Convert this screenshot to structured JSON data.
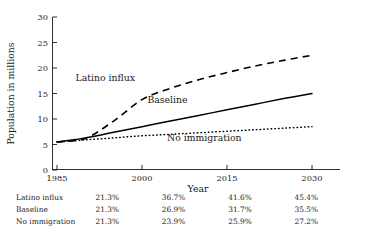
{
  "chart_data": {
    "type": "line",
    "title": "",
    "xlabel": "Year",
    "ylabel": "Population in millions",
    "xlim": [
      1985,
      2032
    ],
    "ylim": [
      0,
      30
    ],
    "xticks": [
      1985,
      2000,
      2015,
      2030
    ],
    "yticks": [
      0,
      5,
      10,
      15,
      20,
      25,
      30
    ],
    "grid": false,
    "legend_position": "inline-labels",
    "x": [
      1985,
      1990,
      1995,
      2000,
      2005,
      2010,
      2015,
      2020,
      2025,
      2030
    ],
    "series": [
      {
        "name": "Latino influx",
        "style": "dashed",
        "color": "#000000",
        "values": [
          5.5,
          6.2,
          9.6,
          13.8,
          16.0,
          17.7,
          19.1,
          20.4,
          21.5,
          22.5
        ]
      },
      {
        "name": "Baseline",
        "style": "solid",
        "color": "#000000",
        "values": [
          5.5,
          6.3,
          7.4,
          8.5,
          9.6,
          10.7,
          11.8,
          12.9,
          14.0,
          15.0
        ]
      },
      {
        "name": "No immigration",
        "style": "dotted",
        "color": "#000000",
        "values": [
          5.5,
          5.9,
          6.3,
          6.7,
          7.0,
          7.3,
          7.6,
          7.9,
          8.2,
          8.5
        ]
      }
    ],
    "annotations": [
      {
        "text": "Latino influx",
        "x": 1993.5,
        "y": 17.4
      },
      {
        "text": "Baseline",
        "x": 2004.5,
        "y": 13.1
      },
      {
        "text": "No immigration",
        "x": 2011.0,
        "y": 5.6
      }
    ]
  },
  "axes": {
    "ylabel": "Population in millions",
    "xlabel": "Year",
    "ytick_labels": [
      "30",
      "25",
      "20",
      "15",
      "10",
      "5",
      "0"
    ],
    "xtick_labels": [
      "1985",
      "2000",
      "2015",
      "2030"
    ]
  },
  "table": {
    "rows": [
      {
        "label": "Latino influx",
        "values": [
          "21.3%",
          "36.7%",
          "41.6%",
          "45.4%"
        ]
      },
      {
        "label": "Baseline",
        "values": [
          "21.3%",
          "26.9%",
          "31.7%",
          "35.5%"
        ]
      },
      {
        "label": "No immigration",
        "values": [
          "21.3%",
          "23.9%",
          "25.9%",
          "27.2%"
        ]
      }
    ]
  }
}
